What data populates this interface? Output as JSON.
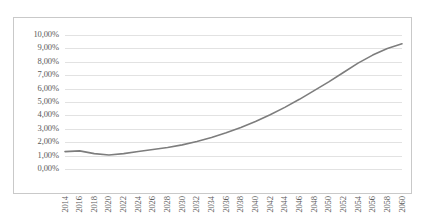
{
  "chart_data": {
    "type": "line",
    "title": "",
    "subtitle": "",
    "xlabel": "",
    "ylabel": "",
    "xlim": [
      2014,
      2060
    ],
    "ylim": [
      0,
      10
    ],
    "grid": true,
    "legend": false,
    "legend_position": "none",
    "y_tick_labels": [
      "10,00%",
      "9,00%",
      "8,00%",
      "7,00%",
      "6,00%",
      "5,00%",
      "4,00%",
      "3,00%",
      "2,00%",
      "1,00%",
      "0,00%"
    ],
    "y_tick_values": [
      10,
      9,
      8,
      7,
      6,
      5,
      4,
      3,
      2,
      1,
      0
    ],
    "x_tick_labels": [
      "2014",
      "2016",
      "2018",
      "2020",
      "2022",
      "2024",
      "2026",
      "2028",
      "2030",
      "2032",
      "2034",
      "2036",
      "2038",
      "2040",
      "2042",
      "2044",
      "2046",
      "2048",
      "2050",
      "2052",
      "2054",
      "2056",
      "2058",
      "2060"
    ],
    "x": [
      2014,
      2016,
      2018,
      2020,
      2022,
      2024,
      2026,
      2028,
      2030,
      2032,
      2034,
      2036,
      2038,
      2040,
      2042,
      2044,
      2046,
      2048,
      2050,
      2052,
      2054,
      2056,
      2058,
      2060
    ],
    "values": [
      1.3,
      1.35,
      1.15,
      1.05,
      1.15,
      1.3,
      1.45,
      1.6,
      1.8,
      2.05,
      2.35,
      2.7,
      3.1,
      3.55,
      4.05,
      4.6,
      5.2,
      5.85,
      6.5,
      7.2,
      7.9,
      8.5,
      9.0,
      9.35
    ],
    "series": [
      {
        "name": "projection",
        "color": "#7d7d7d",
        "values": [
          1.3,
          1.35,
          1.15,
          1.05,
          1.15,
          1.3,
          1.45,
          1.6,
          1.8,
          2.05,
          2.35,
          2.7,
          3.1,
          3.55,
          4.05,
          4.6,
          5.2,
          5.85,
          6.5,
          7.2,
          7.9,
          8.5,
          9.0,
          9.35
        ]
      }
    ]
  },
  "colors": {
    "line": "#7d7d7d",
    "grid": "#e2e2e2",
    "border": "#c9c9c9",
    "tick_text": "#5a5a5a",
    "background": "#ffffff"
  }
}
